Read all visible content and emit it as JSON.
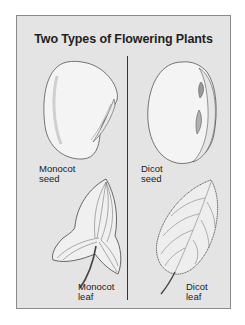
{
  "diagram": {
    "title": "Two Types of Flowering Plants",
    "colors": {
      "panel_background": "#e4e4e4",
      "panel_border": "#8a8a8a",
      "text": "#222222",
      "divider": "#333333"
    },
    "columns": [
      {
        "group": "Monocot",
        "items": [
          {
            "type": "seed",
            "label_line1": "Monocot",
            "label_line2": "seed"
          },
          {
            "type": "leaf",
            "label_line1": "Monocot",
            "label_line2": "leaf"
          }
        ]
      },
      {
        "group": "Dicot",
        "items": [
          {
            "type": "seed",
            "label_line1": "Dicot",
            "label_line2": "seed"
          },
          {
            "type": "leaf",
            "label_line1": "Dicot",
            "label_line2": "leaf"
          }
        ]
      }
    ]
  }
}
